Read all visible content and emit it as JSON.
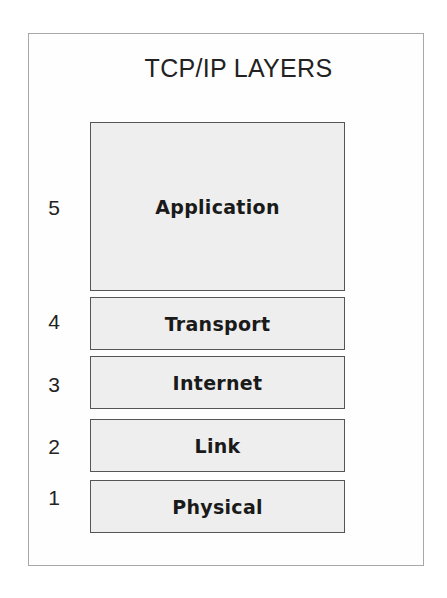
{
  "diagram": {
    "title": "TCP/IP LAYERS",
    "layers": [
      {
        "number": "5",
        "label": "Application",
        "top": 122,
        "height": 169,
        "num_top": 197
      },
      {
        "number": "4",
        "label": "Transport",
        "top": 297,
        "height": 53,
        "num_top": 311
      },
      {
        "number": "3",
        "label": "Internet",
        "top": 356,
        "height": 53,
        "num_top": 374
      },
      {
        "number": "2",
        "label": "Link",
        "top": 419,
        "height": 53,
        "num_top": 436
      },
      {
        "number": "1",
        "label": "Physical",
        "top": 480,
        "height": 53,
        "num_top": 487
      }
    ],
    "colors": {
      "frame_border": "#a8a8a8",
      "box_border": "#555555",
      "box_fill": "#eeeeee",
      "text": "#1a1a1a"
    }
  }
}
